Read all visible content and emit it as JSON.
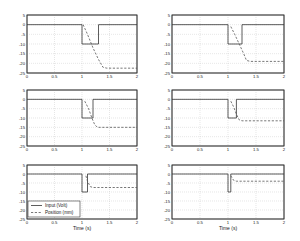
{
  "figure": {
    "xlabel": "Time (s)",
    "legend": {
      "input_label": "Input (Volt)",
      "position_label": "Position (mm)"
    }
  },
  "chart_data": [
    {
      "type": "line",
      "panel": "row1-col1",
      "xlim": [
        0,
        2
      ],
      "ylim": [
        -25,
        5
      ],
      "xticks": [
        "0",
        "0.5",
        "1",
        "1.5",
        "2"
      ],
      "yticks": [
        "5",
        "0",
        "-5",
        "-10",
        "-15",
        "-20",
        "-25"
      ],
      "grid": true,
      "series": [
        {
          "name": "Input (Volt)",
          "style": "solid",
          "points": [
            [
              0,
              0
            ],
            [
              1,
              0
            ],
            [
              1,
              -10
            ],
            [
              1.3,
              -10
            ],
            [
              1.3,
              0
            ],
            [
              2,
              0
            ]
          ]
        },
        {
          "name": "Position (mm)",
          "style": "dashed",
          "points": [
            [
              1.02,
              0
            ],
            [
              1.1,
              -5
            ],
            [
              1.2,
              -12
            ],
            [
              1.3,
              -18
            ],
            [
              1.38,
              -22
            ],
            [
              1.45,
              -22.5
            ],
            [
              2,
              -22.5
            ]
          ]
        }
      ]
    },
    {
      "type": "line",
      "panel": "row1-col2",
      "xlim": [
        0,
        2
      ],
      "ylim": [
        -25,
        5
      ],
      "xticks": [
        "0",
        "0.5",
        "1",
        "1.5",
        "2"
      ],
      "yticks": [
        "5",
        "0",
        "-5",
        "-10",
        "-15",
        "-20",
        "-25"
      ],
      "grid": true,
      "series": [
        {
          "name": "Input (Volt)",
          "style": "solid",
          "points": [
            [
              0,
              0
            ],
            [
              1,
              0
            ],
            [
              1,
              -10
            ],
            [
              1.25,
              -10
            ],
            [
              1.25,
              0
            ],
            [
              2,
              0
            ]
          ]
        },
        {
          "name": "Position (mm)",
          "style": "dashed",
          "points": [
            [
              1.05,
              -1
            ],
            [
              1.12,
              -5
            ],
            [
              1.2,
              -10
            ],
            [
              1.28,
              -15
            ],
            [
              1.33,
              -18.5
            ],
            [
              1.4,
              -19
            ],
            [
              2,
              -19
            ]
          ]
        }
      ]
    },
    {
      "type": "line",
      "panel": "row2-col1",
      "xlim": [
        0,
        2
      ],
      "ylim": [
        -25,
        5
      ],
      "xticks": [
        "0",
        "0.5",
        "1",
        "1.5",
        "2"
      ],
      "yticks": [
        "5",
        "0",
        "-5",
        "-10",
        "-15",
        "-20",
        "-25"
      ],
      "grid": true,
      "series": [
        {
          "name": "Input (Volt)",
          "style": "solid",
          "points": [
            [
              0,
              0
            ],
            [
              1,
              0
            ],
            [
              1,
              -10
            ],
            [
              1.2,
              -10
            ],
            [
              1.2,
              0
            ],
            [
              2,
              0
            ]
          ]
        },
        {
          "name": "Position (mm)",
          "style": "dashed",
          "points": [
            [
              1.05,
              -1
            ],
            [
              1.12,
              -5
            ],
            [
              1.18,
              -10
            ],
            [
              1.23,
              -13.5
            ],
            [
              1.28,
              -15
            ],
            [
              2,
              -15
            ]
          ]
        }
      ]
    },
    {
      "type": "line",
      "panel": "row2-col2",
      "xlim": [
        0,
        2
      ],
      "ylim": [
        -25,
        5
      ],
      "xticks": [
        "0",
        "0.5",
        "1",
        "1.5",
        "2"
      ],
      "yticks": [
        "5",
        "0",
        "-5",
        "-10",
        "-15",
        "-20",
        "-25"
      ],
      "grid": true,
      "series": [
        {
          "name": "Input (Volt)",
          "style": "solid",
          "points": [
            [
              0,
              0
            ],
            [
              1,
              0
            ],
            [
              1,
              -10
            ],
            [
              1.15,
              -10
            ],
            [
              1.15,
              0
            ],
            [
              2,
              0
            ]
          ]
        },
        {
          "name": "Position (mm)",
          "style": "dashed",
          "points": [
            [
              1.05,
              -1
            ],
            [
              1.1,
              -4
            ],
            [
              1.15,
              -8
            ],
            [
              1.2,
              -11
            ],
            [
              1.25,
              -11.5
            ],
            [
              2,
              -11.5
            ]
          ]
        }
      ]
    },
    {
      "type": "line",
      "panel": "row3-col1",
      "xlim": [
        0,
        2
      ],
      "ylim": [
        -25,
        5
      ],
      "xticks": [
        "0",
        "0.5",
        "1",
        "1.5",
        "2"
      ],
      "yticks": [
        "5",
        "0",
        "-5",
        "-10",
        "-15",
        "-20",
        "-25"
      ],
      "grid": true,
      "series": [
        {
          "name": "Input (Volt)",
          "style": "solid",
          "points": [
            [
              0,
              0
            ],
            [
              1,
              0
            ],
            [
              1,
              -10
            ],
            [
              1.1,
              -10
            ],
            [
              1.1,
              0
            ],
            [
              2,
              0
            ]
          ]
        },
        {
          "name": "Position (mm)",
          "style": "dashed",
          "points": [
            [
              1.07,
              -1
            ],
            [
              1.1,
              -4
            ],
            [
              1.15,
              -7
            ],
            [
              1.2,
              -7.5
            ],
            [
              2,
              -7.5
            ]
          ]
        }
      ]
    },
    {
      "type": "line",
      "panel": "row3-col2",
      "xlim": [
        0,
        2
      ],
      "ylim": [
        -25,
        5
      ],
      "xticks": [
        "0",
        "0.5",
        "1",
        "1.5",
        "2"
      ],
      "yticks": [
        "5",
        "0",
        "-5",
        "-10",
        "-15",
        "-20",
        "-25"
      ],
      "grid": true,
      "series": [
        {
          "name": "Input (Volt)",
          "style": "solid",
          "points": [
            [
              0,
              0
            ],
            [
              1,
              0
            ],
            [
              1,
              -10
            ],
            [
              1.05,
              -10
            ],
            [
              1.05,
              0
            ],
            [
              2,
              0
            ]
          ]
        },
        {
          "name": "Position (mm)",
          "style": "dashed",
          "points": [
            [
              1.05,
              -1
            ],
            [
              1.1,
              -3.5
            ],
            [
              1.15,
              -4
            ],
            [
              2,
              -4
            ]
          ]
        }
      ]
    }
  ]
}
